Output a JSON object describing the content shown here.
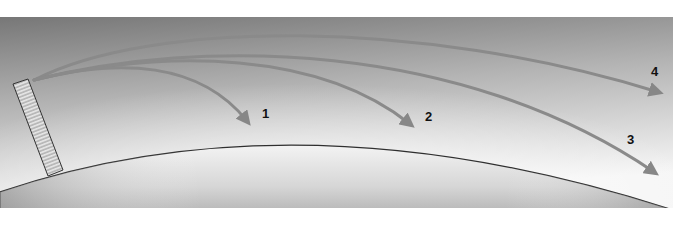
{
  "diagram": {
    "type": "trajectory-diagram",
    "colors": {
      "sky_top": "#7a7a7a",
      "sky_bottom": "#f4f4f4",
      "ground_top": "#f2f2f2",
      "ground_bottom": "#9a9a9a",
      "path": "#8a8a8a",
      "path_dark": "#6f6f6f",
      "label": "#111111",
      "tower_fill": "#bdbdbd",
      "tower_stripe": "#e4e4e4",
      "outline": "#333333"
    },
    "tower": {
      "name": "launch-tower"
    },
    "paths": [
      {
        "id": 1,
        "label": "1",
        "end": "lands near"
      },
      {
        "id": 2,
        "label": "2",
        "end": "lands farther"
      },
      {
        "id": 3,
        "label": "3",
        "end": "lands at horizon"
      },
      {
        "id": 4,
        "label": "4",
        "end": "escapes beyond surface"
      }
    ]
  }
}
